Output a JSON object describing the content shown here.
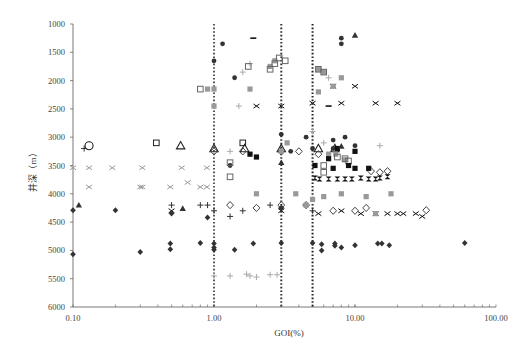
{
  "chart_data": {
    "type": "scatter",
    "title": "",
    "xlabel": "GOI(%)",
    "ylabel": "井深（m）",
    "xscale": "log",
    "xlim": [
      0.1,
      100
    ],
    "ylim": [
      6000,
      1000
    ],
    "y_inverted": true,
    "x_tick_labels": [
      "0.10",
      "1.00",
      "10.00",
      "100.00"
    ],
    "x_ticks": [
      0.1,
      1,
      10,
      100
    ],
    "y_tick_labels": [
      "1000",
      "1500",
      "2000",
      "2500",
      "3000",
      "3500",
      "4000",
      "4500",
      "5000",
      "5500",
      "6000"
    ],
    "y_ticks": [
      1000,
      1500,
      2000,
      2500,
      3000,
      3500,
      4000,
      4500,
      5000,
      5500,
      6000
    ],
    "grid": false,
    "legend": null,
    "reference_lines": [
      {
        "axis": "x",
        "value": 1,
        "style": "dotted",
        "color": "#555555"
      },
      {
        "axis": "x",
        "value": 3,
        "style": "dotted",
        "color": "#333333"
      },
      {
        "axis": "x",
        "value": 5,
        "style": "dotted",
        "color": "#222222"
      }
    ],
    "series": [
      {
        "name": "open-circle",
        "marker": "circle-open",
        "color": "#222222",
        "points": [
          [
            0.13,
            3150
          ]
        ]
      },
      {
        "name": "plus-dark",
        "marker": "plus",
        "color": "#333333",
        "points": [
          [
            0.12,
            3200
          ],
          [
            0.5,
            4200
          ],
          [
            0.8,
            4200
          ],
          [
            0.9,
            4200
          ],
          [
            1.0,
            4300
          ],
          [
            1.3,
            4400
          ],
          [
            1.6,
            4300
          ],
          [
            2.5,
            4200
          ],
          [
            5.0,
            4300
          ],
          [
            3.0,
            4250
          ]
        ]
      },
      {
        "name": "plus-light",
        "marker": "plus",
        "color": "#aaaaaa",
        "points": [
          [
            1.0,
            5450
          ],
          [
            1.3,
            5450
          ],
          [
            1.7,
            5420
          ],
          [
            1.8,
            5450
          ],
          [
            2.0,
            5470
          ],
          [
            2.5,
            5430
          ],
          [
            2.8,
            5430
          ],
          [
            1.8,
            1700
          ],
          [
            1.6,
            1850
          ],
          [
            1.5,
            2450
          ],
          [
            5.0,
            2900
          ],
          [
            6.5,
            1950
          ],
          [
            6.0,
            3100
          ],
          [
            15.0,
            3150
          ],
          [
            1.3,
            3250
          ]
        ]
      },
      {
        "name": "open-square",
        "marker": "square-open",
        "color": "#222222",
        "points": [
          [
            0.39,
            3100
          ],
          [
            1.6,
            3100
          ]
        ]
      },
      {
        "name": "open-triangle",
        "marker": "triangle-open",
        "color": "#222222",
        "points": [
          [
            0.58,
            3150
          ],
          [
            1.0,
            3200
          ],
          [
            1.65,
            3200
          ],
          [
            3.0,
            3200
          ],
          [
            5.5,
            3200
          ],
          [
            7.2,
            3200
          ]
        ]
      },
      {
        "name": "x-light",
        "marker": "x",
        "color": "#999999",
        "points": [
          [
            0.1,
            3540
          ],
          [
            0.13,
            3540
          ],
          [
            0.19,
            3540
          ],
          [
            0.31,
            3540
          ],
          [
            0.59,
            3540
          ],
          [
            0.89,
            3540
          ],
          [
            0.13,
            3880
          ],
          [
            0.3,
            3880
          ],
          [
            0.31,
            3880
          ],
          [
            0.49,
            3880
          ],
          [
            0.65,
            3800
          ],
          [
            0.8,
            3880
          ],
          [
            0.89,
            3880
          ]
        ]
      },
      {
        "name": "x-dark",
        "marker": "x",
        "color": "#111111",
        "points": [
          [
            0.5,
            4300
          ],
          [
            2.0,
            2450
          ],
          [
            3.0,
            2450
          ],
          [
            5.0,
            2400
          ],
          [
            7.0,
            2100
          ],
          [
            10.0,
            2100
          ],
          [
            8.0,
            2400
          ],
          [
            14.0,
            2400
          ],
          [
            20.0,
            2400
          ],
          [
            3.0,
            4300
          ],
          [
            5.5,
            4350
          ],
          [
            8.0,
            4300
          ],
          [
            11.0,
            4350
          ],
          [
            14.0,
            4350
          ],
          [
            17.0,
            4350
          ],
          [
            20.0,
            4350
          ],
          [
            22.0,
            4350
          ],
          [
            30.0,
            4400
          ],
          [
            27.0,
            4350
          ]
        ]
      },
      {
        "name": "diamond-dark",
        "marker": "diamond",
        "color": "#333333",
        "points": [
          [
            0.1,
            4290
          ],
          [
            0.1,
            5070
          ],
          [
            0.2,
            4290
          ],
          [
            0.3,
            5030
          ],
          [
            0.49,
            4880
          ],
          [
            0.49,
            4980
          ],
          [
            0.8,
            4870
          ],
          [
            1.0,
            4880
          ],
          [
            1.0,
            4950
          ],
          [
            1.0,
            4990
          ],
          [
            1.4,
            4990
          ],
          [
            1.9,
            4880
          ],
          [
            3.0,
            4870
          ],
          [
            5.0,
            4870
          ],
          [
            5.8,
            4890
          ],
          [
            5.8,
            5000
          ],
          [
            7.2,
            4880
          ],
          [
            7.2,
            4920
          ],
          [
            8.0,
            4950
          ],
          [
            10.0,
            4910
          ],
          [
            14.5,
            4880
          ],
          [
            15.5,
            4880
          ],
          [
            17.5,
            4910
          ],
          [
            60.0,
            4870
          ],
          [
            0.5,
            4350
          ],
          [
            0.9,
            4420
          ]
        ]
      },
      {
        "name": "diamond-open",
        "marker": "diamond-open",
        "color": "#444444",
        "points": [
          [
            1.0,
            3250
          ],
          [
            1.6,
            3250
          ],
          [
            3.0,
            3250
          ],
          [
            4.0,
            3250
          ],
          [
            5.5,
            3300
          ],
          [
            1.3,
            4200
          ],
          [
            2.0,
            4250
          ],
          [
            3.0,
            4200
          ],
          [
            4.5,
            4200
          ],
          [
            7.0,
            4300
          ],
          [
            10.0,
            4300
          ],
          [
            12.0,
            4250
          ],
          [
            13.0,
            3600
          ],
          [
            15.0,
            3620
          ],
          [
            17.0,
            3600
          ],
          [
            32.0,
            4290
          ]
        ]
      },
      {
        "name": "dot-dark",
        "marker": "circle",
        "color": "#333333",
        "points": [
          [
            1.0,
            1650
          ],
          [
            1.15,
            1350
          ],
          [
            1.4,
            1950
          ],
          [
            1.3,
            3500
          ],
          [
            3.0,
            2950
          ],
          [
            3.5,
            3250
          ],
          [
            4.5,
            3000
          ],
          [
            5.0,
            3200
          ],
          [
            7.0,
            3050
          ],
          [
            7.0,
            3200
          ],
          [
            8.0,
            1250
          ],
          [
            8.0,
            1350
          ],
          [
            10.0,
            3150
          ],
          [
            8.5,
            3000
          ],
          [
            3.0,
            4250
          ]
        ]
      },
      {
        "name": "square-gray",
        "marker": "square",
        "color": "#999999",
        "points": [
          [
            0.9,
            2150
          ],
          [
            1.0,
            2150
          ],
          [
            1.0,
            2450
          ],
          [
            1.8,
            2150
          ],
          [
            3.0,
            3250
          ],
          [
            3.3,
            3100
          ],
          [
            6.5,
            3300
          ],
          [
            7.3,
            3300
          ],
          [
            8.5,
            3400
          ],
          [
            2.7,
            1650
          ],
          [
            2.5,
            1750
          ],
          [
            5.5,
            1800
          ],
          [
            6.0,
            1850
          ],
          [
            7.0,
            2100
          ],
          [
            8.0,
            1950
          ],
          [
            5.5,
            2200
          ],
          [
            2.0,
            4000
          ],
          [
            3.8,
            4000
          ],
          [
            4.5,
            4200
          ],
          [
            5.0,
            4100
          ],
          [
            6.0,
            4050
          ],
          [
            8.0,
            4000
          ],
          [
            12.0,
            4050
          ],
          [
            18.0,
            4000
          ],
          [
            14.0,
            4350
          ]
        ]
      },
      {
        "name": "square-open-gray",
        "marker": "square-open",
        "color": "#666666",
        "points": [
          [
            0.8,
            2150
          ],
          [
            1.75,
            1750
          ],
          [
            2.7,
            1700
          ],
          [
            2.9,
            1600
          ],
          [
            3.2,
            1650
          ],
          [
            2.5,
            1800
          ],
          [
            5.5,
            1800
          ],
          [
            6.0,
            1850
          ],
          [
            1.3,
            3450
          ],
          [
            1.3,
            3700
          ],
          [
            6.0,
            3500
          ],
          [
            6.0,
            3620
          ],
          [
            7.5,
            3350
          ],
          [
            8.5,
            3380
          ],
          [
            9.0,
            3420
          ]
        ]
      },
      {
        "name": "square-dark",
        "marker": "square",
        "color": "#111111",
        "points": [
          [
            1.8,
            3300
          ],
          [
            2.0,
            3350
          ],
          [
            5.2,
            3500
          ],
          [
            6.5,
            3380
          ],
          [
            7.5,
            3200
          ],
          [
            7.0,
            3550
          ],
          [
            10.0,
            3250
          ],
          [
            9.0,
            3500
          ],
          [
            10.0,
            3550
          ],
          [
            12.5,
            3550
          ]
        ]
      },
      {
        "name": "triangle-dark",
        "marker": "triangle",
        "color": "#333333",
        "points": [
          [
            0.11,
            4200
          ],
          [
            0.6,
            4260
          ],
          [
            3.0,
            3450
          ],
          [
            8.0,
            3160
          ],
          [
            10.0,
            1200
          ]
        ]
      },
      {
        "name": "bowtie-dark",
        "marker": "bowtie",
        "color": "#111111",
        "points": [
          [
            5.2,
            3720
          ],
          [
            5.6,
            3740
          ],
          [
            6.5,
            3740
          ],
          [
            7.5,
            3740
          ],
          [
            8.5,
            3740
          ],
          [
            9.5,
            3740
          ],
          [
            11.0,
            3720
          ],
          [
            12.5,
            3740
          ],
          [
            14.0,
            3740
          ],
          [
            15.0,
            3720
          ],
          [
            17.0,
            3700
          ]
        ]
      },
      {
        "name": "dash-dark",
        "marker": "dash",
        "color": "#111111",
        "points": [
          [
            1.9,
            1250
          ],
          [
            6.5,
            2450
          ]
        ]
      }
    ]
  }
}
